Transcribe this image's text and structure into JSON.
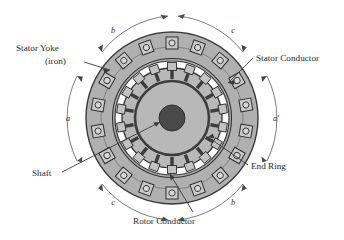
{
  "figure": {
    "type": "cross-section-diagram",
    "background_color": "#ffffff"
  },
  "colors": {
    "stator_yoke_fill": "#b0b0b0",
    "rotor_fill": "#b8b8b8",
    "shaft_fill": "#4a4a4a",
    "air_gap_fill": "#ffffff",
    "outline": "#3a3a3a",
    "end_ring_stroke": "#3d3d3d",
    "label_text": "#2b2b2b",
    "leader_line": "#3a3a3a",
    "arc_line": "#6d6d6d"
  },
  "labels": {
    "stator_yoke_line1": "Stator Yoke",
    "stator_yoke_line2": "(iron)",
    "stator_conductor": "Stator Conductor",
    "shaft": "Shaft",
    "end_ring": "End Ring",
    "rotor_conductor": "Rotor Conductor"
  },
  "phase_bands": [
    {
      "name": "band-b-top",
      "label": "b",
      "direction": "clockwise"
    },
    {
      "name": "band-c-top",
      "label": "c",
      "direction": "counterclockwise"
    },
    {
      "name": "band-a-left",
      "label": "a",
      "direction": "bidirectional"
    },
    {
      "name": "band-a-right",
      "label": "a'",
      "direction": "bidirectional"
    },
    {
      "name": "band-c-bottom",
      "label": "c",
      "direction": "clockwise"
    },
    {
      "name": "band-b-bottom",
      "label": "b",
      "direction": "counterclockwise"
    }
  ],
  "geometry": {
    "center_x": 172,
    "center_y": 118,
    "stator_outer_radius": 86,
    "stator_slot_ring_radius": 64,
    "air_gap_outer_radius": 56,
    "air_gap_inner_radius": 50,
    "rotor_outer_radius": 50,
    "end_ring_radius": 37,
    "shaft_radius": 13,
    "stator_slot_count": 18,
    "rotor_bar_count": 18
  }
}
